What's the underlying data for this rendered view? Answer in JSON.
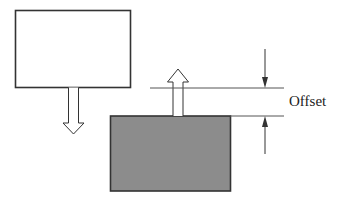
{
  "diagram": {
    "labels": {
      "offset": "Offset"
    },
    "colors": {
      "stroke": "#333333",
      "block_fill": "#8c8c8c",
      "background": "#ffffff"
    },
    "elements": [
      {
        "name": "upper-block",
        "fill": "white"
      },
      {
        "name": "down-arrow",
        "style": "hollow"
      },
      {
        "name": "lower-block",
        "fill": "gray"
      },
      {
        "name": "up-arrow",
        "style": "hollow"
      },
      {
        "name": "offset-dimension",
        "label": "Offset"
      }
    ]
  }
}
